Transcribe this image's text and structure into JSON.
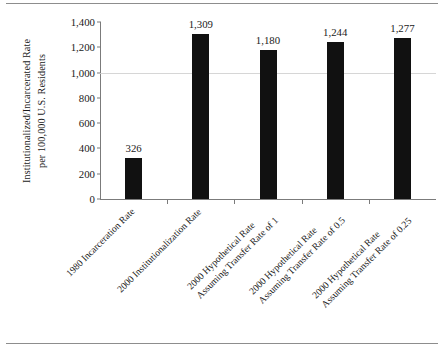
{
  "figure": {
    "rules": {
      "top": "horizontal-rule",
      "bottom": "horizontal-rule"
    }
  },
  "chart_data": {
    "type": "bar",
    "title": "",
    "xlabel": "",
    "ylabel": "Institutionalized/Incarcerated Rate per 100,000 U.S. Residents",
    "ylabel_lines": [
      "Institutionalized/Incarcerated Rate",
      "per 100,000 U.S. Residents"
    ],
    "categories": [
      "1980 Incarceration Rate",
      "2000 Institutionalization Rate",
      "2000 Hypothetical Rate Assuming Transfer Rate of 1",
      "2000 Hypothetical Rate Assuming Transfer Rate of 0.5",
      "2000 Hypothetical Rate Assuming Transfer Rate of 0.25"
    ],
    "category_lines": [
      [
        "1980 Incarceration Rate",
        ""
      ],
      [
        "2000 Institutionalization Rate",
        ""
      ],
      [
        "2000 Hypothetical Rate",
        "Assuming Transfer Rate of 1"
      ],
      [
        "2000 Hypothetical Rate",
        "Assuming Transfer Rate of 0.5"
      ],
      [
        "2000 Hypothetical Rate",
        "Assuming Transfer Rate of 0.25"
      ]
    ],
    "values": [
      326,
      1309,
      1180,
      1244,
      1277
    ],
    "value_labels": [
      "326",
      "1,309",
      "1,180",
      "1,244",
      "1,277"
    ],
    "ylim": [
      0,
      1400
    ],
    "yticks": [
      0,
      200,
      400,
      600,
      800,
      1000,
      1200,
      1400
    ],
    "ytick_labels": [
      "0",
      "200",
      "400",
      "600",
      "800",
      "1,000",
      "1,200",
      "1,400"
    ],
    "grid": false,
    "legend": null,
    "bar_color": "#111111",
    "axis_color": "#7b7b7b"
  }
}
